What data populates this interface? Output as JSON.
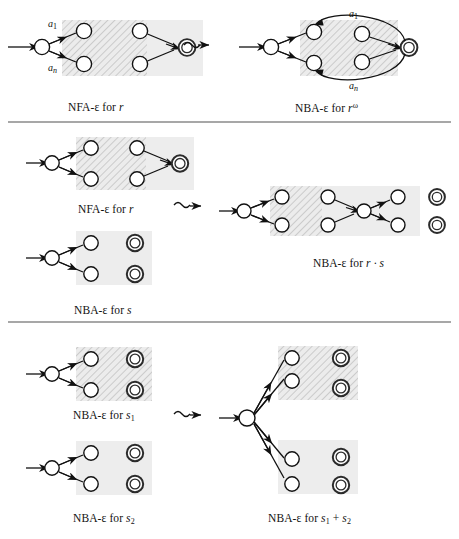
{
  "figure": {
    "colors": {
      "hatch_fill": "#e9e9e9",
      "hatch_stroke": "#b4b4b4",
      "plain_fill": "#ededed",
      "node_stroke": "#111111",
      "accept_stroke": "#2b2b2b",
      "divider": "#8a8a8a",
      "background": "#ffffff"
    },
    "dividers": [
      {
        "name": "divider-1",
        "y": 122
      },
      {
        "name": "divider-2",
        "y": 322
      }
    ]
  },
  "panels": [
    {
      "id": "omega",
      "name": "omega-iteration-panel",
      "source_label": "NFA-ε for ",
      "source_expr": "r",
      "result_label": "NBA-ε for ",
      "result_expr": "r",
      "result_exponent": "ω",
      "transform_glyph": "squiggly-arrow",
      "edge_labels": [
        "a",
        "a"
      ],
      "edge_label_subs": [
        "1",
        "n"
      ],
      "edge_label_top": "a₁",
      "edge_label_bottom": "aₙ"
    },
    {
      "id": "concat",
      "name": "concatenation-panel",
      "source_label_1": "NFA-ε for ",
      "source_expr_1": "r",
      "source_label_2": "NBA-ε for ",
      "source_expr_2": "s",
      "result_label": "NBA-ε for ",
      "result_expr": "r · s",
      "transform_glyph": "squiggly-arrow"
    },
    {
      "id": "union",
      "name": "union-panel",
      "source_label_1": "NBA-ε for ",
      "source_expr_1": "s",
      "source_sub_1": "1",
      "source_label_2": "NBA-ε for ",
      "source_expr_2": "s",
      "source_sub_2": "2",
      "result_label": "NBA-ε for ",
      "result_expr_a": "s",
      "result_sub_a": "1",
      "result_plus": " + ",
      "result_expr_b": "s",
      "result_sub_b": "2",
      "transform_glyph": "squiggly-arrow"
    }
  ],
  "captions": {
    "p1_left": "NFA-ε for r",
    "p1_right": "NBA-ε for rω",
    "p2_left_top": "NFA-ε for r",
    "p2_left_bottom": "NBA-ε for s",
    "p2_right": "NBA-ε for r · s",
    "p3_left_top": "NBA-ε for s1",
    "p3_left_bottom": "NBA-ε for s2",
    "p3_right": "NBA-ε for s1 + s2"
  }
}
